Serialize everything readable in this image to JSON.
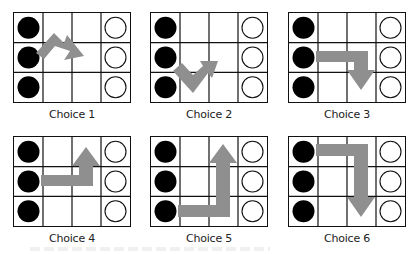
{
  "figure": {
    "grid": {
      "rows": 3,
      "cols": 4,
      "left_column": "filled-black-circles",
      "right_column": "hollow-circles"
    },
    "colors": {
      "arrow": "#8f8f8f",
      "grid_line": "#111111",
      "filled_circle": "#000000",
      "hollow_circle_stroke": "#111111"
    },
    "choices": [
      {
        "label": "Choice 1",
        "arrow": "up-right then down-right zigzag from middle-left to middle of column 3"
      },
      {
        "label": "Choice 2",
        "arrow": "down-right then up-right V from bottom-left to middle of column 3"
      },
      {
        "label": "Choice 3",
        "arrow": "right along middle row then down into bottom row, column 3"
      },
      {
        "label": "Choice 4",
        "arrow": "right along middle row then up into top row, column 3"
      },
      {
        "label": "Choice 5",
        "arrow": "right along bottom row then up into top row, column 3"
      },
      {
        "label": "Choice 6",
        "arrow": "right along top row then down into bottom row, column 3"
      }
    ]
  }
}
